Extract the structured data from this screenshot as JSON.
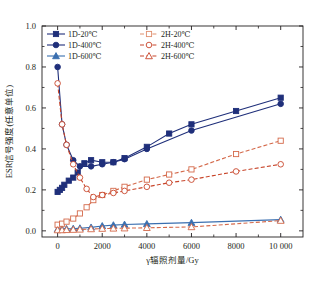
{
  "chart_data": {
    "type": "line",
    "title": "",
    "xlabel": "γ辐照剂量/Gy",
    "ylabel": "ESR信号强度(任意单位)",
    "xlim": [
      -700,
      11000
    ],
    "ylim": [
      -0.03,
      1.0
    ],
    "grid": false,
    "legend_position": "top-left-inside",
    "xticks": [
      0,
      2000,
      4000,
      6000,
      8000,
      10000
    ],
    "xticklabels": [
      "0",
      "2000",
      "4000",
      "6000",
      "8000",
      "10 000"
    ],
    "yticks": [
      0.0,
      0.2,
      0.4,
      0.6,
      0.8,
      1.0
    ],
    "yticklabels": [
      "0.0",
      "0.2",
      "0.4",
      "0.6",
      "0.8",
      "1.0"
    ],
    "yminorticks": [
      0.1,
      0.3,
      0.5,
      0.7,
      0.9
    ],
    "colors": {
      "blue": "#1f2f7a",
      "blue_light": "#4a7ec0",
      "red": "#c8452a",
      "red_light": "#e08f6e",
      "axis": "#231f20"
    },
    "series": [
      {
        "name": "1D-20℃",
        "color": "#1f2f7a",
        "marker": "square",
        "filled": true,
        "dash": false,
        "x": [
          0,
          100,
          200,
          300,
          500,
          700,
          900,
          1200,
          1500,
          2000,
          2500,
          3000,
          4000,
          5000,
          6000,
          8000,
          10000
        ],
        "y": [
          0.19,
          0.2,
          0.21,
          0.225,
          0.245,
          0.26,
          0.285,
          0.33,
          0.345,
          0.335,
          0.335,
          0.355,
          0.41,
          0.475,
          0.52,
          0.585,
          0.65
        ]
      },
      {
        "name": "1D-400℃",
        "color": "#1f2f7a",
        "marker": "circle",
        "filled": true,
        "dash": false,
        "x": [
          0,
          200,
          400,
          700,
          1000,
          1500,
          2000,
          2500,
          3000,
          4000,
          6000,
          10000
        ],
        "y": [
          0.8,
          0.52,
          0.42,
          0.345,
          0.315,
          0.315,
          0.325,
          0.335,
          0.35,
          0.4,
          0.49,
          0.62
        ]
      },
      {
        "name": "1D-600℃",
        "color": "#3a6fb0",
        "marker": "triangle",
        "filled": true,
        "dash": false,
        "x": [
          0,
          200,
          400,
          700,
          1000,
          1500,
          2000,
          2500,
          3000,
          4000,
          6000,
          10000
        ],
        "y": [
          0.008,
          0.009,
          0.01,
          0.011,
          0.013,
          0.017,
          0.024,
          0.028,
          0.031,
          0.034,
          0.04,
          0.055
        ]
      },
      {
        "name": "2H-20℃",
        "color": "#d4694a",
        "marker": "square",
        "filled": false,
        "dash": true,
        "x": [
          0,
          200,
          400,
          700,
          1000,
          1300,
          1600,
          2000,
          2500,
          3000,
          4000,
          5000,
          6000,
          8000,
          10000
        ],
        "y": [
          0.03,
          0.035,
          0.045,
          0.06,
          0.085,
          0.115,
          0.15,
          0.175,
          0.195,
          0.215,
          0.25,
          0.275,
          0.3,
          0.375,
          0.44
        ]
      },
      {
        "name": "2H-400℃",
        "color": "#c8452a",
        "marker": "circle",
        "filled": false,
        "dash": true,
        "x": [
          0,
          200,
          400,
          700,
          1000,
          1300,
          1600,
          2000,
          2500,
          3000,
          4000,
          5000,
          6000,
          8000,
          10000
        ],
        "y": [
          0.72,
          0.52,
          0.42,
          0.325,
          0.26,
          0.205,
          0.165,
          0.175,
          0.185,
          0.195,
          0.215,
          0.235,
          0.25,
          0.29,
          0.325
        ]
      },
      {
        "name": "2H-600℃",
        "color": "#d4694a",
        "marker": "triangle",
        "filled": false,
        "dash": true,
        "x": [
          0,
          200,
          400,
          700,
          1000,
          1500,
          2000,
          2500,
          3000,
          4000,
          6000,
          10000
        ],
        "y": [
          0.004,
          0.004,
          0.005,
          0.006,
          0.007,
          0.009,
          0.011,
          0.012,
          0.013,
          0.015,
          0.019,
          0.05
        ]
      }
    ],
    "legend": [
      {
        "label": "1D-20℃",
        "color": "#1f2f7a",
        "marker": "square",
        "filled": true,
        "dash": false
      },
      {
        "label": "2H-20℃",
        "color": "#e08f6e",
        "marker": "square",
        "filled": false,
        "dash": true
      },
      {
        "label": "1D-400℃",
        "color": "#1f2f7a",
        "marker": "circle",
        "filled": true,
        "dash": false
      },
      {
        "label": "2H-400℃",
        "color": "#c8452a",
        "marker": "circle",
        "filled": false,
        "dash": true
      },
      {
        "label": "1D-600℃",
        "color": "#3a6fb0",
        "marker": "triangle",
        "filled": true,
        "dash": false
      },
      {
        "label": "2H-600℃",
        "color": "#c8452a",
        "marker": "triangle",
        "filled": false,
        "dash": true
      }
    ]
  }
}
